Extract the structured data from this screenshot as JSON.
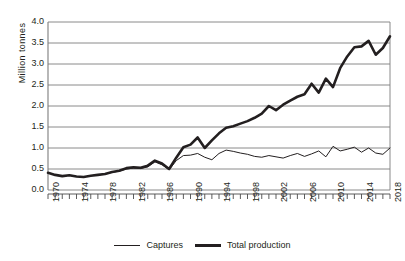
{
  "chart_data": {
    "type": "line",
    "title": "",
    "xlabel": "",
    "ylabel": "Million tonnes",
    "xlim": [
      1970,
      2018
    ],
    "ylim": [
      0.0,
      4.0
    ],
    "grid": true,
    "legend_position": "bottom",
    "ytick_labels": [
      "4.0",
      "3.5",
      "3.0",
      "2.5",
      "2.0",
      "1.5",
      "1.0",
      "0.5",
      "0.0"
    ],
    "ytick_values": [
      4.0,
      3.5,
      3.0,
      2.5,
      2.0,
      1.5,
      1.0,
      0.5,
      0.0
    ],
    "xtick_labels": [
      "1970",
      "1974",
      "1978",
      "1982",
      "1986",
      "1990",
      "1994",
      "1998",
      "2002",
      "2006",
      "2010",
      "2014",
      "2018"
    ],
    "xtick_values": [
      1970,
      1974,
      1978,
      1982,
      1986,
      1990,
      1994,
      1998,
      2002,
      2006,
      2010,
      2014,
      2018
    ],
    "x": [
      1970,
      1971,
      1972,
      1973,
      1974,
      1975,
      1976,
      1977,
      1978,
      1979,
      1980,
      1981,
      1982,
      1983,
      1984,
      1985,
      1986,
      1987,
      1988,
      1989,
      1990,
      1991,
      1992,
      1993,
      1994,
      1995,
      1996,
      1997,
      1998,
      1999,
      2000,
      2001,
      2002,
      2003,
      2004,
      2005,
      2006,
      2007,
      2008,
      2009,
      2010,
      2011,
      2012,
      2013,
      2014,
      2015,
      2016,
      2017,
      2018
    ],
    "series": [
      {
        "name": "Captures",
        "line_style": "thin",
        "color": "#231f20",
        "values": [
          0.41,
          0.36,
          0.33,
          0.35,
          0.32,
          0.31,
          0.34,
          0.36,
          0.38,
          0.42,
          0.45,
          0.5,
          0.52,
          0.51,
          0.55,
          0.67,
          0.6,
          0.48,
          0.7,
          0.82,
          0.83,
          0.87,
          0.78,
          0.72,
          0.87,
          0.95,
          0.92,
          0.88,
          0.85,
          0.8,
          0.78,
          0.82,
          0.79,
          0.76,
          0.82,
          0.87,
          0.8,
          0.86,
          0.93,
          0.79,
          1.04,
          0.93,
          0.97,
          1.02,
          0.9,
          1.0,
          0.88,
          0.85,
          1.0
        ]
      },
      {
        "name": "Total production",
        "line_style": "thick",
        "color": "#231f20",
        "values": [
          0.41,
          0.36,
          0.33,
          0.35,
          0.32,
          0.31,
          0.34,
          0.36,
          0.38,
          0.43,
          0.46,
          0.52,
          0.54,
          0.53,
          0.58,
          0.7,
          0.63,
          0.5,
          0.77,
          1.02,
          1.08,
          1.25,
          1.0,
          1.18,
          1.35,
          1.48,
          1.52,
          1.58,
          1.64,
          1.72,
          1.82,
          2.0,
          1.9,
          2.03,
          2.13,
          2.22,
          2.28,
          2.53,
          2.32,
          2.65,
          2.45,
          2.9,
          3.18,
          3.4,
          3.42,
          3.55,
          3.22,
          3.38,
          3.66
        ]
      }
    ]
  },
  "legend": {
    "entries": [
      {
        "label": "Captures",
        "style": "thin"
      },
      {
        "label": "Total production",
        "style": "thick"
      }
    ]
  }
}
